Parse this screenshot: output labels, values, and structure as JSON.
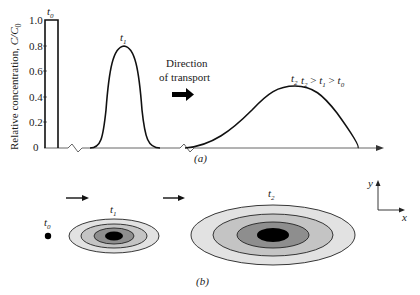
{
  "panel_a": {
    "y_axis_label_prefix": "Relative concentration, ",
    "y_axis_label_var": "C/C",
    "y_axis_label_sub": "0",
    "y_ticks": [
      "1.0",
      "0.8",
      "0.6",
      "0.4",
      "0.2",
      "0"
    ],
    "t0_label": "t",
    "t0_sub": "0",
    "t1_label": "t",
    "t1_sub": "1",
    "t2_label": "t",
    "t2_sub": "2",
    "direction_line1": "Direction",
    "direction_line2": "of transport",
    "inequality": {
      "a": "t",
      "a_sub": "2",
      "op1": " > ",
      "b": "t",
      "b_sub": "1",
      "op2": " > ",
      "c": "t",
      "c_sub": "0"
    },
    "caption": "(a)"
  },
  "panel_b": {
    "t0_label": "t",
    "t0_sub": "0",
    "t1_label": "t",
    "t1_sub": "1",
    "t2_label": "t",
    "t2_sub": "2",
    "axis_y": "y",
    "axis_x": "x",
    "caption": "(b)"
  },
  "colors": {
    "line": "#111111",
    "axis": "#555555",
    "ring_outer": "#e2e2e2",
    "ring_mid": "#c4c4c4",
    "ring_inner": "#8e8e8e",
    "core": "#000000"
  }
}
